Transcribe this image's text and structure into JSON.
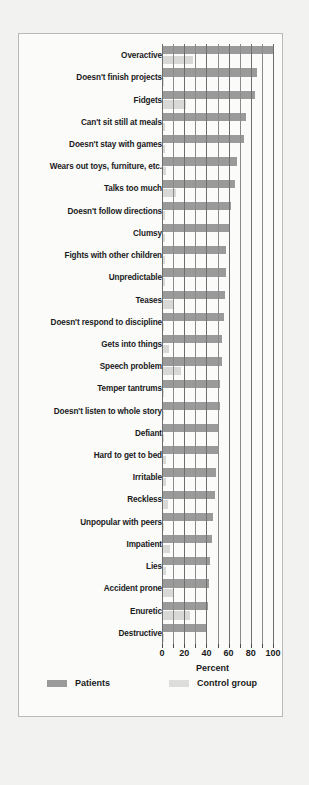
{
  "chart_data": {
    "type": "bar",
    "orientation": "horizontal",
    "title": "",
    "xlabel": "Percent",
    "ylabel": "",
    "xlim": [
      0,
      100
    ],
    "xticks": [
      0,
      20,
      40,
      60,
      80,
      100
    ],
    "xticklabels": [
      "0",
      "20",
      "40",
      "60",
      "80",
      "100"
    ],
    "minor_tick_step": 10,
    "grid": true,
    "legend_position": "bottom",
    "categories": [
      "Overactive",
      "Doesn't finish projects",
      "Fidgets",
      "Can't sit still at meals",
      "Doesn't stay with games",
      "Wears out toys, furniture, etc.",
      "Talks too much",
      "Doesn't follow directions",
      "Clumsy",
      "Fights with other children",
      "Unpredictable",
      "Teases",
      "Doesn't respond to discipline",
      "Gets into things",
      "Speech problem",
      "Temper tantrums",
      "Doesn't listen to whole story",
      "Defiant",
      "Hard to get to bed",
      "Irritable",
      "Reckless",
      "Unpopular with peers",
      "Impatient",
      "Lies",
      "Accident prone",
      "Enuretic",
      "Destructive"
    ],
    "series": [
      {
        "name": "Patients",
        "color": "#9a9a9a",
        "values": [
          100,
          86,
          84,
          76,
          74,
          68,
          66,
          62,
          60,
          58,
          58,
          57,
          56,
          54,
          54,
          52,
          52,
          50,
          50,
          49,
          48,
          46,
          45,
          43,
          42,
          41,
          40
        ]
      },
      {
        "name": "Control group",
        "color": "#d8d8d6",
        "values": [
          28,
          2,
          22,
          3,
          3,
          4,
          13,
          3,
          3,
          3,
          3,
          11,
          2,
          6,
          17,
          2,
          2,
          2,
          4,
          4,
          5,
          2,
          7,
          4,
          10,
          25,
          2
        ]
      }
    ],
    "legend": [
      {
        "label": "Patients",
        "swatch": "#9a9a9a"
      },
      {
        "label": "Control group",
        "swatch": "#dddddb"
      }
    ]
  },
  "colors": {
    "page_background": "#f2f2f0",
    "figure_background": "#fbfbfa",
    "figure_border": "#b9b9b9",
    "gridline": "#6e6e6e",
    "text": "#1a1a1a"
  }
}
